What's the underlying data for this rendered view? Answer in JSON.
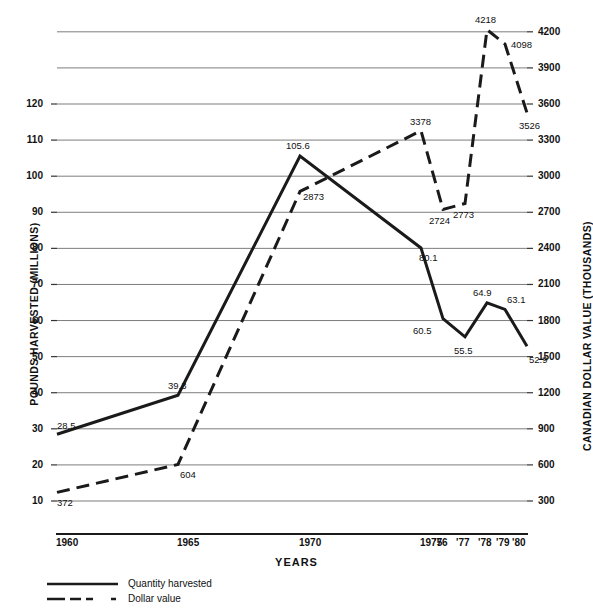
{
  "chart_data": {
    "type": "line",
    "title": "",
    "xlabel": "YEARS",
    "ylabel": "POUNDS HARVESTED (MILLIONS)",
    "ylabel_right": "CANADIAN DOLLAR VALUE (THOUSANDS)",
    "grid": true,
    "legend_position": "bottom-left",
    "categories": [
      "1960",
      "1965",
      "1970",
      "1975",
      "'76",
      "'77",
      "'78",
      "'79",
      "'80"
    ],
    "x_tick_labels": [
      "1960",
      "1965",
      "1970",
      "1975",
      "'76",
      "'77",
      "'78",
      "'79",
      "'80"
    ],
    "left_axis": {
      "label": "POUNDS HARVESTED (MILLIONS)",
      "ticks": [
        10,
        20,
        30,
        40,
        50,
        60,
        70,
        80,
        90,
        100,
        110,
        120
      ],
      "tick_labels": [
        "10",
        "20",
        "30",
        "40",
        "50",
        "60",
        "70",
        "80",
        "90",
        "100",
        "110",
        "120"
      ],
      "ylim": [
        10,
        140
      ]
    },
    "right_axis": {
      "label": "CANADIAN DOLLAR VALUE (THOUSANDS)",
      "ticks": [
        300,
        600,
        900,
        1200,
        1500,
        1800,
        2100,
        2400,
        2700,
        3000,
        3300,
        3600,
        3900,
        4200
      ],
      "tick_labels": [
        "300",
        "600",
        "900",
        "1200",
        "1500",
        "1800",
        "2100",
        "2400",
        "2700",
        "3000",
        "3300",
        "3600",
        "3900",
        "4200"
      ],
      "ylim": [
        300,
        4200
      ]
    },
    "series": [
      {
        "name": "Quantity harvested",
        "axis": "left",
        "style": "solid",
        "color": "#1a1a1a",
        "values": [
          28.5,
          39.3,
          105.6,
          80.1,
          60.5,
          55.5,
          64.9,
          63.1,
          52.9
        ],
        "point_labels": [
          "28.5",
          "39.3",
          "105.6",
          "80.1",
          "60.5",
          "55.5",
          "64.9",
          "63.1",
          "52.9"
        ]
      },
      {
        "name": "Dollar value",
        "axis": "right",
        "style": "dashed",
        "color": "#1a1a1a",
        "values": [
          372,
          604,
          2873,
          3378,
          2724,
          2773,
          4218,
          4098,
          3526
        ],
        "point_labels": [
          "372",
          "604",
          "2873",
          "3378",
          "2724",
          "2773",
          "4218",
          "4098",
          "3526"
        ]
      }
    ]
  },
  "legend": {
    "items": [
      {
        "label": "Quantity harvested",
        "style": "solid"
      },
      {
        "label": "Dollar value",
        "style": "dashed"
      }
    ]
  }
}
